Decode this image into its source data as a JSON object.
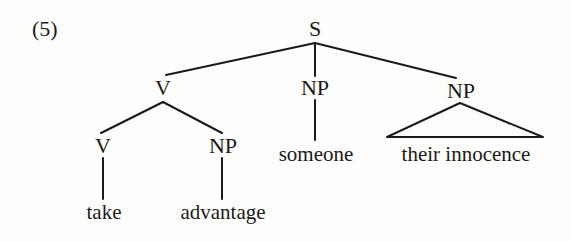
{
  "example": {
    "number": "(5)"
  },
  "tree": {
    "nodes": {
      "s": "S",
      "v_upper": "V",
      "np_middle": "NP",
      "np_right": "NP",
      "v_lower": "V",
      "np_lower": "NP"
    },
    "leaves": {
      "take": "take",
      "advantage": "advantage",
      "someone": "someone",
      "their_innocence": "their innocence"
    }
  },
  "colors": {
    "ink": "#1a1a1a",
    "paper": "#fdfdfc"
  }
}
